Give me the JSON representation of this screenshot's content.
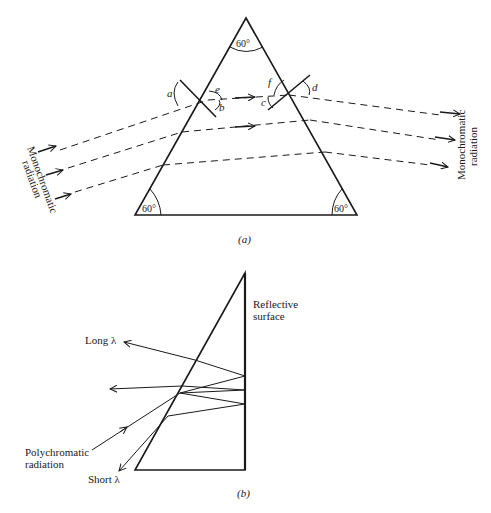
{
  "figure_a": {
    "caption": "(a)",
    "apex_angle": "60°",
    "left_base_angle": "60°",
    "right_base_angle": "60°",
    "angle_labels": {
      "a": "a",
      "b": "b",
      "c": "c",
      "d": "d",
      "e": "e",
      "f": "f"
    },
    "input_label_line1": "Monochromatic",
    "input_label_line2": "radiation",
    "output_label_line1": "Monochromatic",
    "output_label_line2": "radiation"
  },
  "figure_b": {
    "caption": "(b)",
    "reflective_label_line1": "Reflective",
    "reflective_label_line2": "surface",
    "long_label": "Long λ",
    "short_label": "Short λ",
    "poly_label_line1": "Polychromatic",
    "poly_label_line2": "radiation"
  },
  "colors": {
    "ink": "#1a1a1a",
    "background": "#ffffff"
  }
}
